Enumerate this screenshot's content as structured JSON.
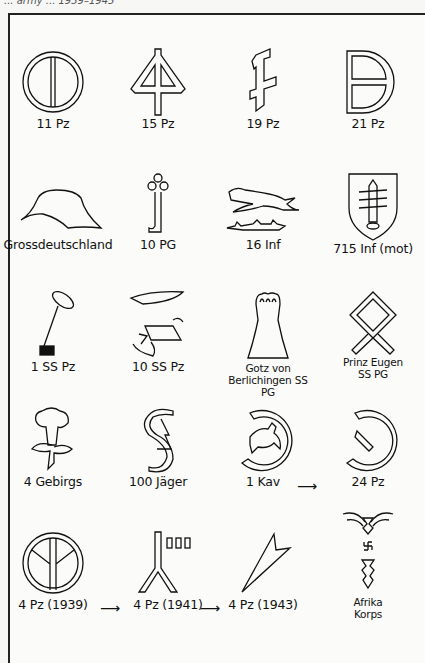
{
  "header": {
    "title": "... army ... 1939–1945"
  },
  "emblems": [
    {
      "id": "11pz",
      "label": "11 Pz"
    },
    {
      "id": "15pz",
      "label": "15 Pz"
    },
    {
      "id": "19pz",
      "label": "19 Pz"
    },
    {
      "id": "21pz",
      "label": "21 Pz"
    },
    {
      "id": "gd",
      "label": "Grossdeutschland"
    },
    {
      "id": "10pg",
      "label": "10 PG"
    },
    {
      "id": "16inf",
      "label": "16 Inf"
    },
    {
      "id": "715inf",
      "label": "715 Inf (mot)"
    },
    {
      "id": "1sspz",
      "label": "1 SS Pz"
    },
    {
      "id": "10sspz",
      "label": "10 SS Pz"
    },
    {
      "id": "gvb",
      "label": "Gotz von Berlichingen SS PG"
    },
    {
      "id": "pe",
      "label": "Prinz Eugen SS PG"
    },
    {
      "id": "4geb",
      "label": "4 Gebirgs"
    },
    {
      "id": "100j",
      "label": "100 Jäger"
    },
    {
      "id": "1kav",
      "label": "1 Kav"
    },
    {
      "id": "24pz",
      "label": "24 Pz"
    },
    {
      "id": "4pz39",
      "label": "4 Pz (1939)"
    },
    {
      "id": "4pz41",
      "label": "4 Pz (1941)"
    },
    {
      "id": "4pz43",
      "label": "4 Pz (1943)"
    },
    {
      "id": "dak",
      "label": "Afrika Korps"
    }
  ],
  "arrows": {
    "symbol": "⟶"
  }
}
